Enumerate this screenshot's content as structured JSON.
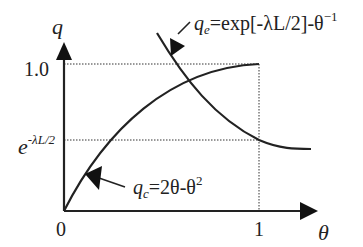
{
  "diagram": {
    "axes": {
      "y_label": "q",
      "x_label": "θ",
      "origin_label": "0",
      "x_tick_one": "1",
      "y_tick_one": "1.0",
      "y_tick_exp_base": "e",
      "y_tick_exp_power": "-λL/2"
    },
    "curves": {
      "q_c": {
        "symbol": "q",
        "subscript": "c",
        "formula_rhs_a": "=2θ-θ",
        "formula_sup": "2"
      },
      "q_e": {
        "symbol": "q",
        "subscript": "e",
        "formula_rhs": "=exp[-λL/2]-θ",
        "formula_sup": "−1"
      }
    },
    "colors": {
      "stroke": "#222222",
      "background": "#ffffff"
    }
  }
}
